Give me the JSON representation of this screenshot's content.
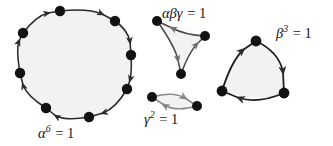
{
  "figure": {
    "width": 333,
    "height": 146,
    "background": "#ffffff"
  },
  "style": {
    "edge_color": "#2b2b2b",
    "node_color": "#121212",
    "fill_color": "#f2f2f2",
    "light_edge_color": "#7d7d7d",
    "text_color": "#151515"
  },
  "shapes": [
    {
      "id": "alpha-cycle",
      "name": "octagon-cycle",
      "order": 8,
      "orientation": "clockwise",
      "edge_curvature": "slightly-convex",
      "label": {
        "base": "α",
        "exponent": "6",
        "equals": "=",
        "value": "1",
        "text": "α⁶ = 1"
      }
    },
    {
      "id": "alphabetagamma-cycle",
      "name": "concave-triangle-cycle",
      "order": 3,
      "orientation": "clockwise",
      "edge_curvature": "concave",
      "label": {
        "base": "αβγ",
        "exponent": "",
        "equals": "=",
        "value": "1",
        "text": "αβγ = 1"
      }
    },
    {
      "id": "gamma-cycle",
      "name": "digon-cycle",
      "order": 2,
      "orientation": "clockwise",
      "edge_curvature": "lens",
      "label": {
        "base": "γ",
        "exponent": "2",
        "equals": "=",
        "value": "1",
        "text": "γ² = 1"
      }
    },
    {
      "id": "beta-cycle",
      "name": "rounded-triangle-cycle",
      "order": 3,
      "orientation": "clockwise",
      "edge_curvature": "convex",
      "label": {
        "base": "β",
        "exponent": "3",
        "equals": "=",
        "value": "1",
        "text": "β³ = 1"
      }
    }
  ],
  "labels": {
    "alpha": {
      "base": "α",
      "exp": "6",
      "eq": "=",
      "one": "1"
    },
    "alphabetagamma": {
      "base": "αβγ",
      "exp": "",
      "eq": "=",
      "one": "1"
    },
    "gamma": {
      "base": "γ",
      "exp": "2",
      "eq": "=",
      "one": "1"
    },
    "beta": {
      "base": "β",
      "exp": "3",
      "eq": "=",
      "one": "1"
    }
  }
}
